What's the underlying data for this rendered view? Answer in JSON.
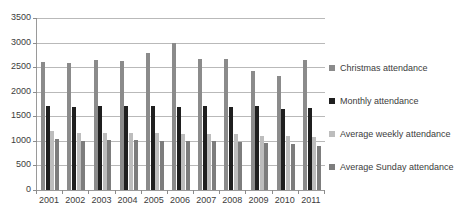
{
  "chart_data": {
    "type": "bar",
    "title": "Church attendance",
    "xlabel": "",
    "ylabel": "",
    "ylim": [
      0,
      3500
    ],
    "ytick_step": 500,
    "yticks": [
      0,
      500,
      1000,
      1500,
      2000,
      2500,
      3000,
      3500
    ],
    "ytick_labels": [
      "0",
      "500",
      "1000",
      "1500",
      "2000",
      "2500",
      "3000",
      "3500"
    ],
    "grid": true,
    "legend_position": "right",
    "categories": [
      "2001",
      "2002",
      "2003",
      "2004",
      "2005",
      "2006",
      "2007",
      "2008",
      "2009",
      "2010",
      "2011"
    ],
    "series": [
      {
        "name": "Christmas attendance",
        "color": "#8b8b8b",
        "values": [
          2600,
          2590,
          2640,
          2620,
          2790,
          3000,
          2660,
          2660,
          2430,
          2310,
          2650
        ]
      },
      {
        "name": "Monthly attendance",
        "color": "#1f1f1f",
        "values": [
          1710,
          1680,
          1700,
          1710,
          1710,
          1690,
          1700,
          1690,
          1700,
          1640,
          1660
        ]
      },
      {
        "name": "Average weekly attendance",
        "color": "#bdbdbd",
        "values": [
          1200,
          1170,
          1170,
          1170,
          1170,
          1150,
          1150,
          1130,
          1100,
          1090,
          1080
        ]
      },
      {
        "name": "Average Sunday attendance",
        "color": "#7d7d7d",
        "values": [
          1040,
          1000,
          1020,
          1010,
          1000,
          1000,
          990,
          980,
          950,
          930,
          900
        ]
      }
    ]
  },
  "legend": {
    "items": [
      {
        "label": "Christmas attendance",
        "color": "#8b8b8b"
      },
      {
        "label": "Monthly attendance",
        "color": "#1f1f1f"
      },
      {
        "label": "Average weekly attendance",
        "color": "#bdbdbd"
      },
      {
        "label": "Average Sunday attendance",
        "color": "#7d7d7d"
      }
    ]
  }
}
